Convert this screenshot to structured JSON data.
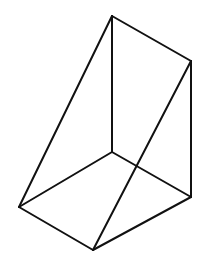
{
  "figure": {
    "type": "wireframe-triangular-prism",
    "stroke_color": "#111111",
    "background": "#ffffff",
    "vertices": {
      "A": [
        112,
        16
      ],
      "B": [
        191,
        61
      ],
      "C": [
        112,
        152
      ],
      "D": [
        191,
        197
      ],
      "E": [
        19,
        207
      ],
      "F": [
        93,
        250
      ]
    },
    "edges": [
      [
        "A",
        "B"
      ],
      [
        "A",
        "C"
      ],
      [
        "A",
        "E"
      ],
      [
        "B",
        "D"
      ],
      [
        "B",
        "F"
      ],
      [
        "C",
        "E"
      ],
      [
        "C",
        "D"
      ],
      [
        "E",
        "F"
      ],
      [
        "F",
        "D"
      ]
    ]
  }
}
